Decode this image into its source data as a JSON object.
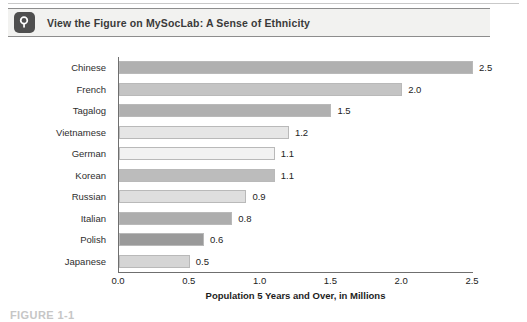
{
  "header": {
    "icon": "magnifier-icon",
    "title": "View the Figure on MySocLab: A Sense of Ethnicity"
  },
  "figure": {
    "caption": "FIGURE 1-1"
  },
  "chart_data": {
    "type": "bar",
    "orientation": "horizontal",
    "title": "",
    "categories": [
      "Chinese",
      "French",
      "Tagalog",
      "Vietnamese",
      "German",
      "Korean",
      "Russian",
      "Italian",
      "Polish",
      "Japanese"
    ],
    "values": [
      2.5,
      2.0,
      1.5,
      1.2,
      1.1,
      1.1,
      0.9,
      0.8,
      0.6,
      0.5
    ],
    "value_labels": [
      "2.5",
      "2.0",
      "1.5",
      "1.2",
      "1.1",
      "1.1",
      "0.9",
      "0.8",
      "0.6",
      "0.5"
    ],
    "bar_colors": [
      "#b0b0b0",
      "#c4c4c4",
      "#b0b0b0",
      "#e6e6e6",
      "#f2f2f2",
      "#bcbcbc",
      "#dedede",
      "#adadad",
      "#9a9a9a",
      "#d5d5d5"
    ],
    "xlabel": "Population 5 Years and Over, in Millions",
    "ylabel": "",
    "xlim": [
      0.0,
      2.5
    ],
    "xticks": [
      0.0,
      0.5,
      1.0,
      1.5,
      2.0,
      2.5
    ],
    "xtick_labels": [
      "0.0",
      "0.5",
      "1.0",
      "1.5",
      "2.0",
      "2.5"
    ],
    "grid": false,
    "legend": null
  },
  "colors": {
    "banner_background": "#f2f2f0",
    "banner_border": "#8d8d8d",
    "icon_background": "#4f4f4f",
    "axis": "#6f6f6f",
    "text": "#2b2b2b"
  }
}
